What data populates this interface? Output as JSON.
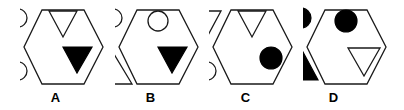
{
  "figure": {
    "type": "shape-reasoning-panels",
    "background_color": "#ffffff",
    "stroke_color": "#1a1a1a",
    "fill_black": "#000000",
    "fill_white": "#ffffff",
    "panel_count": 4
  },
  "panels": [
    {
      "label": "A",
      "container": "hexagon",
      "outside_shapes": [
        {
          "shape": "circle",
          "fill": "white",
          "position": "upper-left"
        },
        {
          "shape": "circle",
          "fill": "white",
          "position": "lower-left"
        }
      ],
      "inside_shapes": [
        {
          "shape": "triangle-down",
          "fill": "white",
          "position": "top-center"
        },
        {
          "shape": "triangle-down",
          "fill": "black",
          "position": "bottom-right"
        }
      ]
    },
    {
      "label": "B",
      "container": "hexagon",
      "outside_shapes": [
        {
          "shape": "circle",
          "fill": "white",
          "position": "upper-left"
        },
        {
          "shape": "triangle-up",
          "fill": "white",
          "position": "lower-left"
        }
      ],
      "inside_shapes": [
        {
          "shape": "circle",
          "fill": "white",
          "position": "top-center"
        },
        {
          "shape": "triangle-down",
          "fill": "black",
          "position": "bottom-right"
        }
      ]
    },
    {
      "label": "C",
      "container": "hexagon",
      "outside_shapes": [
        {
          "shape": "triangle-down",
          "fill": "white",
          "position": "upper-left"
        },
        {
          "shape": "circle",
          "fill": "white",
          "position": "lower-left"
        }
      ],
      "inside_shapes": [
        {
          "shape": "triangle-down",
          "fill": "white",
          "position": "top-center"
        },
        {
          "shape": "circle",
          "fill": "black",
          "position": "middle-right"
        }
      ]
    },
    {
      "label": "D",
      "container": "hexagon",
      "outside_shapes": [
        {
          "shape": "circle",
          "fill": "black",
          "position": "upper-left"
        },
        {
          "shape": "triangle-up",
          "fill": "black",
          "position": "lower-left"
        }
      ],
      "inside_shapes": [
        {
          "shape": "circle",
          "fill": "black",
          "position": "top-center"
        },
        {
          "shape": "triangle-down",
          "fill": "white",
          "position": "bottom-right"
        }
      ]
    }
  ]
}
